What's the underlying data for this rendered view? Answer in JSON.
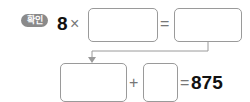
{
  "badge": {
    "label": "확인"
  },
  "equation1": {
    "multiplicand": "8",
    "times_sign": "×",
    "equals_sign": "=",
    "box1_value": "",
    "box2_value": ""
  },
  "equation2": {
    "box3_value": "",
    "plus_sign": "+",
    "box4_value": "",
    "equals_sign": "=",
    "result": "875"
  },
  "colors": {
    "badge": "#8a8a8a",
    "border": "#9a9a9a",
    "connector": "#9a9a9a"
  }
}
